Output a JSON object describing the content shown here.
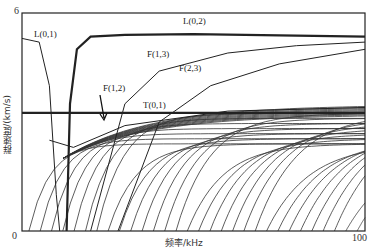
{
  "chart_data": {
    "type": "line",
    "title": "",
    "xlabel": "频率/kHz",
    "ylabel": "群速度/(km/s)",
    "xlim": [
      0,
      100
    ],
    "ylim": [
      0,
      6
    ],
    "x_ticks": [
      "0",
      "100"
    ],
    "y_ticks": [
      "0",
      "6"
    ],
    "grid": false,
    "legend": "none (inline mode labels)",
    "series": [
      {
        "name": "L(0,1)",
        "x": [
          0,
          5,
          8,
          10,
          11
        ],
        "values": [
          5.3,
          5.2,
          4.0,
          1.0,
          0.0
        ]
      },
      {
        "name": "L(0,2)",
        "x": [
          13,
          14,
          16,
          20,
          30,
          50,
          100
        ],
        "values": [
          0.0,
          3.5,
          5.0,
          5.35,
          5.4,
          5.42,
          5.35
        ]
      },
      {
        "name": "F(1,3)",
        "x": [
          20,
          30,
          40,
          60,
          80,
          100
        ],
        "values": [
          0.0,
          3.5,
          4.4,
          4.9,
          5.1,
          5.2
        ]
      },
      {
        "name": "F(2,3)",
        "x": [
          28,
          40,
          55,
          75,
          100
        ],
        "values": [
          0.0,
          3.0,
          4.0,
          4.6,
          5.0
        ]
      },
      {
        "name": "F(1,2)",
        "x": [
          8,
          15,
          30,
          60,
          100
        ],
        "values": [
          2.5,
          2.3,
          2.9,
          3.3,
          3.4
        ]
      },
      {
        "name": "T(0,1)",
        "x": [
          0,
          100
        ],
        "values": [
          3.25,
          3.25
        ]
      }
    ],
    "annotations": [
      "L(0,1)",
      "L(0,2)",
      "F(1,3)",
      "F(2,3)",
      "F(1,2)",
      "T(0,1)"
    ],
    "arrow": {
      "label": "F(1,2)",
      "points_to": [
        28,
        2.9
      ]
    }
  },
  "labels": {
    "l01": "L(0,1)",
    "l02": "L(0,2)",
    "f13": "F(1,3)",
    "f23": "F(2,3)",
    "f12": "F(1,2)",
    "t01": "T(0,1)"
  },
  "axes": {
    "x_min": "0",
    "x_max": "100",
    "y_min": "0",
    "y_max": "6",
    "xlabel": "频率/kHz",
    "ylabel": "群速度/(km/s)"
  }
}
